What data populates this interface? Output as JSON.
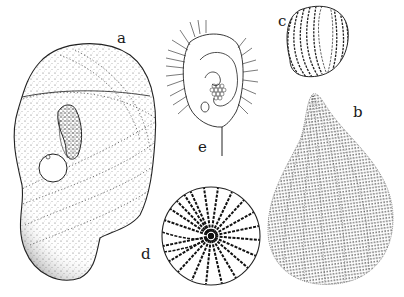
{
  "figure": {
    "panels": [
      {
        "id": "a",
        "label": "a",
        "description": "large irregular stippled cell with concentric dotted bands, dark inclusion and spherical vacuole"
      },
      {
        "id": "b",
        "label": "b",
        "description": "teardrop-shaped cell covered in dense dotted longitudinal striations"
      },
      {
        "id": "c",
        "label": "c",
        "description": "small ovoid cell with curved longitudinal dashed ribs"
      },
      {
        "id": "d",
        "label": "d",
        "description": "circular cell viewed from pole with radiating striped pattern"
      },
      {
        "id": "e",
        "label": "e",
        "description": "ciliated cell with spiral oral groove, food vacuole cluster and caudal bristle"
      }
    ],
    "ink_color": "#1a1a1a",
    "background_color": "#ffffff"
  }
}
